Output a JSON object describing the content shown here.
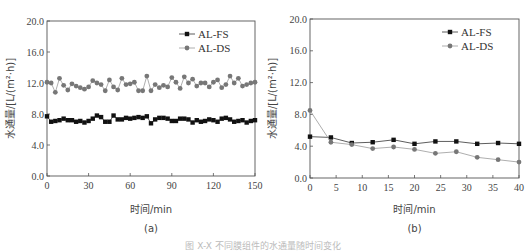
{
  "chart_data": [
    {
      "type": "line",
      "panel_label": "(a)",
      "xlabel": "时间/min",
      "ylabel": "水通量/[L/(m²·h)]",
      "xlim": [
        0,
        150
      ],
      "ylim": [
        0,
        20
      ],
      "xticks": [
        "0",
        "30",
        "60",
        "90",
        "120",
        "150"
      ],
      "xtick_values": [
        0,
        30,
        60,
        90,
        120,
        150
      ],
      "yticks": [
        "0.0",
        "4.0",
        "8.0",
        "12.0",
        "16.0",
        "20.0"
      ],
      "ytick_values": [
        0,
        4,
        8,
        12,
        16,
        20
      ],
      "legend": "top-right",
      "grid": false,
      "series": [
        {
          "name": "AL-FS",
          "marker": "square",
          "color": "#111111",
          "x": [
            0,
            3,
            6,
            9,
            12,
            15,
            18,
            21,
            24,
            27,
            30,
            33,
            36,
            39,
            42,
            45,
            48,
            51,
            54,
            57,
            60,
            63,
            66,
            69,
            72,
            75,
            78,
            81,
            84,
            87,
            90,
            93,
            96,
            99,
            102,
            105,
            108,
            111,
            114,
            117,
            120,
            123,
            126,
            129,
            132,
            135,
            138,
            141,
            144,
            147,
            150
          ],
          "y": [
            7.7,
            7.0,
            7.1,
            7.2,
            7.4,
            7.2,
            7.2,
            7.0,
            7.1,
            6.9,
            7.1,
            7.4,
            7.8,
            7.6,
            7.0,
            7.0,
            7.8,
            7.3,
            7.3,
            7.5,
            7.4,
            7.5,
            7.6,
            7.5,
            7.7,
            6.8,
            7.3,
            7.5,
            7.5,
            7.4,
            7.1,
            7.1,
            7.4,
            7.4,
            7.3,
            6.9,
            7.2,
            7.0,
            7.1,
            7.3,
            7.2,
            7.0,
            7.4,
            7.5,
            7.3,
            7.0,
            7.1,
            7.2,
            6.9,
            7.1,
            7.2
          ]
        },
        {
          "name": "AL-DS",
          "marker": "circle",
          "color": "#777777",
          "x": [
            0,
            3,
            6,
            9,
            12,
            15,
            18,
            21,
            24,
            27,
            30,
            33,
            36,
            39,
            42,
            45,
            48,
            51,
            54,
            57,
            60,
            63,
            66,
            69,
            72,
            75,
            78,
            81,
            84,
            87,
            90,
            93,
            96,
            99,
            102,
            105,
            108,
            111,
            114,
            117,
            120,
            123,
            126,
            129,
            132,
            135,
            138,
            141,
            144,
            147,
            150
          ],
          "y": [
            12.1,
            12.0,
            10.8,
            12.6,
            11.7,
            11.1,
            11.9,
            11.6,
            11.4,
            11.2,
            11.5,
            12.3,
            12.0,
            11.8,
            11.0,
            12.4,
            11.5,
            11.1,
            12.6,
            11.8,
            11.9,
            12.1,
            11.0,
            11.0,
            12.9,
            11.0,
            11.8,
            11.4,
            11.7,
            11.5,
            12.7,
            12.1,
            11.3,
            12.8,
            12.0,
            12.5,
            11.6,
            12.0,
            12.0,
            11.5,
            12.1,
            12.4,
            11.4,
            11.8,
            12.9,
            12.0,
            12.6,
            11.6,
            11.8,
            12.0,
            12.1
          ]
        }
      ]
    },
    {
      "type": "line",
      "panel_label": "(b)",
      "xlabel": "时间/min",
      "ylabel": "水通量/[L/(m²·h)]",
      "xlim": [
        0,
        40
      ],
      "ylim": [
        0,
        20
      ],
      "xticks": [
        "0",
        "5",
        "10",
        "15",
        "20",
        "25",
        "30",
        "35",
        "40"
      ],
      "xtick_values": [
        0,
        5,
        10,
        15,
        20,
        25,
        30,
        35,
        40
      ],
      "yticks": [
        "0.0",
        "4.0",
        "8.0",
        "12.0",
        "16.0",
        "20.0"
      ],
      "ytick_values": [
        0,
        4,
        8,
        12,
        16,
        20
      ],
      "legend": "top-right",
      "grid": false,
      "series": [
        {
          "name": "AL-FS",
          "marker": "square",
          "color": "#111111",
          "x": [
            0,
            4,
            8,
            12,
            16,
            20,
            24,
            28,
            32,
            36,
            40
          ],
          "y": [
            5.2,
            5.1,
            4.4,
            4.5,
            4.8,
            4.3,
            4.6,
            4.6,
            4.3,
            4.4,
            4.3
          ]
        },
        {
          "name": "AL-DS",
          "marker": "circle",
          "color": "#777777",
          "x": [
            0,
            4,
            8,
            12,
            16,
            20,
            24,
            28,
            32,
            36,
            40
          ],
          "y": [
            8.5,
            4.5,
            4.2,
            3.7,
            3.9,
            3.6,
            3.1,
            3.3,
            2.6,
            2.3,
            2.0
          ]
        }
      ]
    }
  ],
  "caption": "图 X-X 不同膜组件的水通量随时间变化"
}
